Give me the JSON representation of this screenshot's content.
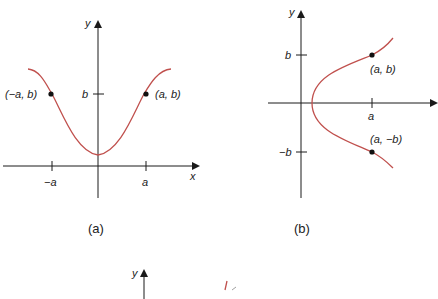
{
  "figures": [
    {
      "id": "a",
      "caption": "(a)",
      "axis_labels": {
        "x": "x",
        "y": "y"
      },
      "tick_labels": {
        "neg_a": "−a",
        "a": "a",
        "b": "b"
      },
      "points": [
        {
          "label": "(−a, b)"
        },
        {
          "label": "(a, b)"
        }
      ],
      "description": "Bell-shaped curve symmetric about the y-axis (even function)"
    },
    {
      "id": "b",
      "caption": "(b)",
      "axis_labels": {
        "y": "y"
      },
      "tick_labels": {
        "b": "b",
        "neg_b": "−b",
        "a": "a"
      },
      "points": [
        {
          "label": "(a, b)"
        },
        {
          "label": "(a, −b)"
        }
      ],
      "description": "Sideways parabola-like curve symmetric about the x-axis"
    },
    {
      "id": "c",
      "axis_labels": {
        "y": "y"
      },
      "description": "Third figure partially visible (cropped at bottom)"
    }
  ],
  "colors": {
    "curve": "#c0504d",
    "axis": "#1a1a1a",
    "point": "#111111"
  }
}
